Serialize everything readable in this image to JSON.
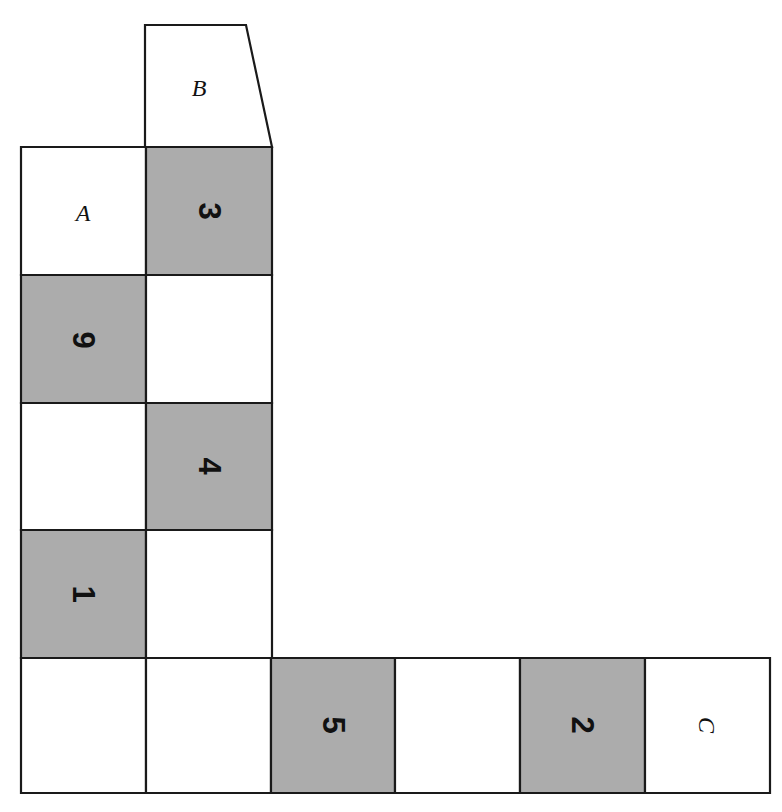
{
  "figure": {
    "colors": {
      "shaded_fill": "#acacac",
      "plain_fill": "#ffffff",
      "stroke": "#1a1a1a",
      "background": "#ffffff"
    },
    "canvas": {
      "width": 782,
      "height": 812
    }
  },
  "cells": [
    {
      "id": "cell-b",
      "label": "B",
      "label_kind": "letter",
      "shaded": false,
      "rotation": 0,
      "shape": "trapezoid",
      "points": "145,25 246,25 272,147 145,147",
      "label_x": 199,
      "label_y": 88
    },
    {
      "id": "cell-a",
      "label": "A",
      "label_kind": "letter",
      "shaded": false,
      "rotation": 0,
      "shape": "rect",
      "points": "21,147 146,147 146,275 21,275",
      "label_x": 83,
      "label_y": 213
    },
    {
      "id": "cell-3",
      "label": "3",
      "label_kind": "number",
      "shaded": true,
      "rotation": 90,
      "shape": "rect",
      "points": "146,147 272,147 272,275 146,275",
      "label_x": 209,
      "label_y": 211
    },
    {
      "id": "cell-9",
      "label": "9",
      "label_kind": "number",
      "shaded": true,
      "rotation": 90,
      "shape": "rect",
      "points": "21,275 146,275 146,403 21,403",
      "label_x": 83,
      "label_y": 340
    },
    {
      "id": "cell-b2-blank",
      "label": "",
      "label_kind": "none",
      "shaded": false,
      "rotation": 0,
      "shape": "rect",
      "points": "146,275 272,275 272,403 146,403",
      "label_x": 209,
      "label_y": 339
    },
    {
      "id": "cell-a3-blank",
      "label": "",
      "label_kind": "none",
      "shaded": false,
      "rotation": 0,
      "shape": "rect",
      "points": "21,403 146,403 146,530 21,530",
      "label_x": 83,
      "label_y": 466
    },
    {
      "id": "cell-4",
      "label": "4",
      "label_kind": "number",
      "shaded": true,
      "rotation": 90,
      "shape": "rect",
      "points": "146,403 272,403 272,530 146,530",
      "label_x": 209,
      "label_y": 466
    },
    {
      "id": "cell-1",
      "label": "1",
      "label_kind": "number",
      "shaded": true,
      "rotation": 90,
      "shape": "rect",
      "points": "21,530 146,530 146,658 21,658",
      "label_x": 83,
      "label_y": 594
    },
    {
      "id": "cell-b4-blank",
      "label": "",
      "label_kind": "none",
      "shaded": false,
      "rotation": 0,
      "shape": "rect",
      "points": "146,530 272,530 272,658 146,658",
      "label_x": 209,
      "label_y": 594
    },
    {
      "id": "cell-bottom-1-blank",
      "label": "",
      "label_kind": "none",
      "shaded": false,
      "rotation": 0,
      "shape": "rect",
      "points": "21,658 146,658 146,793 21,793",
      "label_x": 83,
      "label_y": 725
    },
    {
      "id": "cell-bottom-2-blank",
      "label": "",
      "label_kind": "none",
      "shaded": false,
      "rotation": 0,
      "shape": "rect",
      "points": "146,658 271,658 271,793 146,793",
      "label_x": 208,
      "label_y": 725
    },
    {
      "id": "cell-5",
      "label": "5",
      "label_kind": "number",
      "shaded": true,
      "rotation": 90,
      "shape": "rect",
      "points": "271,658 395,658 395,793 271,793",
      "label_x": 333,
      "label_y": 725
    },
    {
      "id": "cell-bottom-4-blank",
      "label": "",
      "label_kind": "none",
      "shaded": false,
      "rotation": 0,
      "shape": "rect",
      "points": "395,658 520,658 520,793 395,793",
      "label_x": 457,
      "label_y": 725
    },
    {
      "id": "cell-2",
      "label": "2",
      "label_kind": "number",
      "shaded": true,
      "rotation": 90,
      "shape": "rect",
      "points": "520,658 645,658 645,793 520,793",
      "label_x": 582,
      "label_y": 725
    },
    {
      "id": "cell-c",
      "label": "C",
      "label_kind": "letter",
      "shaded": false,
      "rotation": 90,
      "shape": "rect",
      "points": "645,658 770,658 770,793 645,793",
      "label_x": 707,
      "label_y": 725
    }
  ]
}
